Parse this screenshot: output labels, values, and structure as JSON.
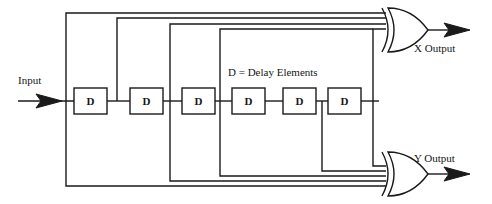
{
  "diagram": {
    "legend_note": "D = Delay Elements",
    "input_label": "Input",
    "outputs": [
      {
        "name": "x-output",
        "label": "X Output"
      },
      {
        "name": "y-output",
        "label": "Y Output"
      }
    ],
    "delay_elements": [
      {
        "id": "d1",
        "label": "D",
        "x": 74,
        "y": 88,
        "w": 33,
        "h": 26
      },
      {
        "id": "d2",
        "label": "D",
        "x": 130,
        "y": 88,
        "w": 33,
        "h": 26
      },
      {
        "id": "d3",
        "label": "D",
        "x": 182,
        "y": 88,
        "w": 33,
        "h": 26
      },
      {
        "id": "d4",
        "label": "D",
        "x": 232,
        "y": 88,
        "w": 33,
        "h": 26
      },
      {
        "id": "d5",
        "label": "D",
        "x": 283,
        "y": 88,
        "w": 33,
        "h": 26
      },
      {
        "id": "d6",
        "label": "D",
        "x": 328,
        "y": 88,
        "w": 33,
        "h": 26
      }
    ],
    "tap_points_x": [
      66,
      117,
      170,
      220,
      322,
      373
    ],
    "top_rail_y": [
      13,
      18,
      24,
      29
    ],
    "bottom_rail_y": [
      186,
      181,
      176,
      171
    ],
    "signal_line_y": 101,
    "gates": [
      {
        "id": "xor-x",
        "type": "xor",
        "x": 384,
        "y": 8,
        "w": 44,
        "h": 44,
        "out_x": 466
      },
      {
        "id": "xor-y",
        "type": "xor",
        "x": 384,
        "y": 152,
        "w": 44,
        "h": 44,
        "out_x": 466
      }
    ],
    "colors": {
      "line": "#1a1a1a",
      "text": "#151515",
      "background": "#ffffff"
    }
  }
}
